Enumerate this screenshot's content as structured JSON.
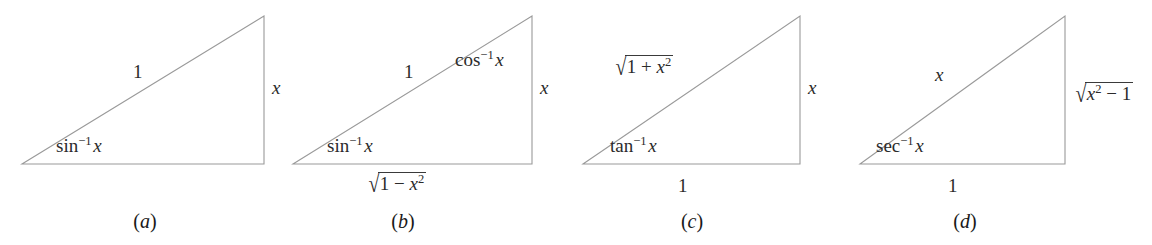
{
  "figure": {
    "type": "math-diagram",
    "background_color": "#ffffff",
    "line_color": "#9a9a9a",
    "text_color": "#2b2b2b",
    "width": 1152,
    "height": 245
  },
  "panels": [
    {
      "caption": "a",
      "caption_open": "(",
      "caption_close": ")",
      "caption_x": 145,
      "geometry": {
        "left_x": 22,
        "right_x": 264,
        "top_y": 16,
        "base_y": 164
      },
      "labels": {
        "hypotenuse": {
          "text": "1",
          "x": 133,
          "y": 62,
          "parts": [
            {
              "t": "1",
              "style": "roman"
            }
          ]
        },
        "vertical": {
          "text": "x",
          "x": 272,
          "y": 78,
          "parts": [
            {
              "t": "x",
              "style": "italic"
            }
          ]
        },
        "angle": {
          "text": "sin⁻¹ x",
          "x": 56,
          "y": 136,
          "base": "sin",
          "exponent": "−1",
          "arg": "x"
        },
        "base": null
      }
    },
    {
      "caption": "b",
      "caption_open": "(",
      "caption_close": ")",
      "caption_x": 403,
      "geometry": {
        "left_x": 293,
        "right_x": 532,
        "top_y": 16,
        "base_y": 164
      },
      "labels": {
        "hypotenuse": {
          "text": "1",
          "x": 404,
          "y": 62,
          "parts": [
            {
              "t": "1",
              "style": "roman"
            }
          ]
        },
        "vertical": {
          "text": "x",
          "x": 540,
          "y": 78,
          "parts": [
            {
              "t": "x",
              "style": "italic"
            }
          ]
        },
        "angle": {
          "text": "sin⁻¹ x",
          "x": 327,
          "y": 136,
          "base": "sin",
          "exponent": "−1",
          "arg": "x"
        },
        "top_angle": {
          "text": "cos⁻¹ x",
          "x": 455,
          "y": 50,
          "base": "cos",
          "exponent": "−1",
          "arg": "x"
        },
        "base": {
          "text": "√(1 − x²)",
          "x": 366,
          "y": 172,
          "radicand_pre": "1 − ",
          "radicand_var": "x",
          "radicand_exp": "2"
        }
      }
    },
    {
      "caption": "c",
      "caption_open": "(",
      "caption_close": ")",
      "caption_x": 692,
      "geometry": {
        "left_x": 583,
        "right_x": 800,
        "top_y": 16,
        "base_y": 164
      },
      "labels": {
        "hypotenuse": {
          "text": "√(1 + x²)",
          "x": 613,
          "y": 55,
          "radicand_pre": "1 + ",
          "radicand_var": "x",
          "radicand_exp": "2"
        },
        "vertical": {
          "text": "x",
          "x": 808,
          "y": 78,
          "parts": [
            {
              "t": "x",
              "style": "italic"
            }
          ]
        },
        "angle": {
          "text": "tan⁻¹ x",
          "x": 610,
          "y": 136,
          "base": "tan",
          "exponent": "−1",
          "arg": "x"
        },
        "base": {
          "text": "1",
          "x": 678,
          "y": 176,
          "parts": [
            {
              "t": "1",
              "style": "roman"
            }
          ]
        }
      }
    },
    {
      "caption": "d",
      "caption_open": "(",
      "caption_close": ")",
      "caption_x": 965,
      "geometry": {
        "left_x": 860,
        "right_x": 1065,
        "top_y": 16,
        "base_y": 164
      },
      "labels": {
        "hypotenuse": {
          "text": "x",
          "x": 935,
          "y": 65,
          "parts": [
            {
              "t": "x",
              "style": "italic"
            }
          ]
        },
        "vertical": {
          "text": "√(x² − 1)",
          "x": 1073,
          "y": 82,
          "radicand_var": "x",
          "radicand_exp": "2",
          "radicand_post": " − 1"
        },
        "angle": {
          "text": "sec⁻¹ x",
          "x": 876,
          "y": 136,
          "base": "sec",
          "exponent": "−1",
          "arg": "x"
        },
        "base": {
          "text": "1",
          "x": 948,
          "y": 176,
          "parts": [
            {
              "t": "1",
              "style": "roman"
            }
          ]
        }
      }
    }
  ],
  "glyphs": {
    "radical_sign": "√",
    "minus": "−",
    "plus": "+",
    "superscript_minus_one": "−1"
  }
}
